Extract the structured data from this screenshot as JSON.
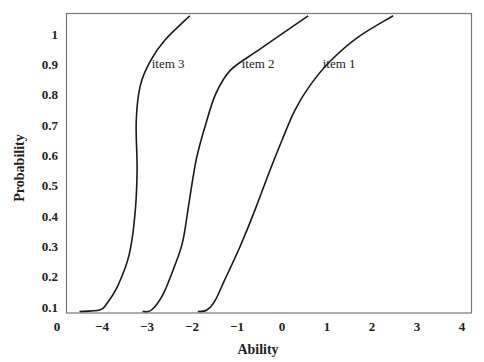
{
  "chart_data": {
    "type": "line",
    "title": "",
    "xlabel": "Ability",
    "ylabel": "Probability",
    "xlim": [
      -5,
      4.3
    ],
    "ylim": [
      0.08,
      1.07
    ],
    "grid": false,
    "legend": "inline labels",
    "x_ticks": [
      "0",
      "−4",
      "−3",
      "−2",
      "−1",
      "0",
      "1",
      "2",
      "3",
      "4"
    ],
    "y_ticks": [
      "1",
      "0.9",
      "0.8",
      "0.7",
      "0.6",
      "0.5",
      "0.4",
      "0.3",
      "0.2",
      "0.1"
    ],
    "series": [
      {
        "name": "item 3",
        "x": [
          -4.5,
          -4.05,
          -3.9,
          -3.65,
          -3.4,
          -3.27,
          -3.22,
          -3.24,
          -3.15,
          -2.93,
          -2.6,
          -2.05
        ],
        "y": [
          0.085,
          0.09,
          0.11,
          0.17,
          0.27,
          0.4,
          0.55,
          0.71,
          0.83,
          0.91,
          0.98,
          1.06
        ]
      },
      {
        "name": "item 2",
        "x": [
          -3.1,
          -2.9,
          -2.65,
          -2.4,
          -2.2,
          -2.05,
          -1.9,
          -1.7,
          -1.48,
          -1.15,
          -0.49,
          0.58
        ],
        "y": [
          0.085,
          0.09,
          0.14,
          0.23,
          0.32,
          0.46,
          0.59,
          0.7,
          0.8,
          0.88,
          0.95,
          1.06
        ]
      },
      {
        "name": "item 1",
        "x": [
          -1.87,
          -1.67,
          -1.49,
          -1.27,
          -0.93,
          -0.6,
          -0.27,
          0.0,
          0.29,
          0.62,
          1.07,
          1.69,
          2.47
        ],
        "y": [
          0.085,
          0.09,
          0.12,
          0.19,
          0.3,
          0.42,
          0.55,
          0.65,
          0.75,
          0.83,
          0.91,
          0.99,
          1.06
        ]
      }
    ],
    "annotations": [
      {
        "text": "item 3",
        "x": -2.85,
        "y": 0.9
      },
      {
        "text": "item 2",
        "x": -0.85,
        "y": 0.9
      },
      {
        "text": "item 1",
        "x": 0.95,
        "y": 0.9
      }
    ]
  }
}
